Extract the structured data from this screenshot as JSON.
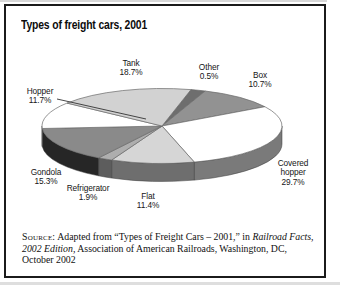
{
  "title": "Types of freight cars, 2001",
  "chart_data": {
    "type": "pie",
    "title": "Types of freight cars, 2001",
    "unit": "percent",
    "style": "3d-pie, grayscale, black hairline slice outlines, labels outside with name over percent",
    "slices": [
      {
        "label": "Other",
        "value": 0.5,
        "color": "#6e6e6e",
        "side_color": null,
        "label_x": 209,
        "label_y": 63
      },
      {
        "label": "Box",
        "value": 10.7,
        "color": "#929292",
        "side_color": null,
        "label_x": 260,
        "label_y": 71
      },
      {
        "label": "Covered hopper",
        "value": 29.7,
        "color": "#ffffff",
        "side_color": "#7a7a7a",
        "label_x": 293,
        "label_y": 159,
        "wrap": true
      },
      {
        "label": "Flat",
        "value": 11.4,
        "color": "#d6d6d6",
        "side_color": "#6e6e6e",
        "label_x": 148,
        "label_y": 192
      },
      {
        "label": "Refrigerator",
        "value": 1.9,
        "color": "#aeaeae",
        "side_color": "#5d5d5d",
        "label_x": 88,
        "label_y": 184
      },
      {
        "label": "Gondola",
        "value": 15.3,
        "color": "#8a8a8a",
        "side_color": "#262626",
        "label_x": 46,
        "label_y": 168
      },
      {
        "label": "Hopper",
        "value": 11.7,
        "color": "#ffffff",
        "side_color": "#9c9c9c",
        "label_x": 40,
        "label_y": 87
      },
      {
        "label": "Tank",
        "value": 18.7,
        "color": "#d2d2d2",
        "side_color": null,
        "label_x": 131,
        "label_y": 59
      }
    ],
    "layout": {
      "cx": 162,
      "cy": 126,
      "rx": 120,
      "ry": 37.5,
      "depth": 18,
      "start_angle_deg": 14,
      "min_display_pct": 2.0,
      "outline_color": "#6a6a6a",
      "leader_line": {
        "x1": 57,
        "y1": 99,
        "x2": 146,
        "y2": 119,
        "color": "#333333"
      },
      "legend": "none, labels placed around pie"
    }
  },
  "source": {
    "prefix": "Source:",
    "segments": [
      {
        "text": " Adapted from “Types of Freight Cars – 2001,” in ",
        "style": "normal"
      },
      {
        "text": "Railroad Facts, 2002 Edition,",
        "style": "italic"
      },
      {
        "text": " Association of American Railroads, Washington, DC, October 2002",
        "style": "normal"
      }
    ]
  }
}
